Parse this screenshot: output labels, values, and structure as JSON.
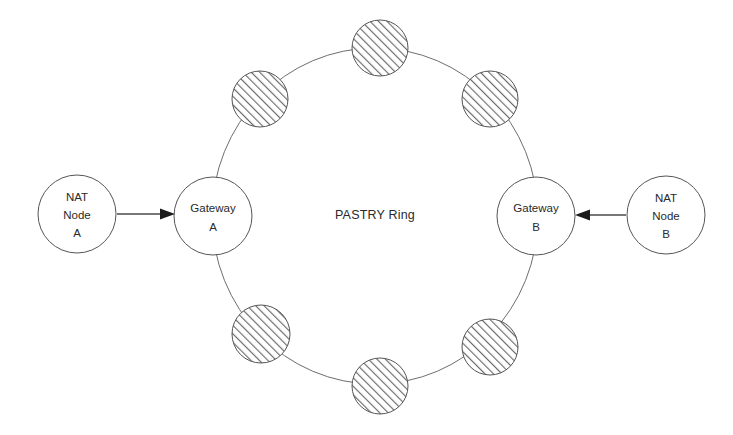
{
  "diagram": {
    "type": "network-topology",
    "center_label": "PASTRY Ring",
    "ring": {
      "center": {
        "x": 375,
        "y": 216
      },
      "radius_x": 163,
      "radius_y": 168,
      "stroke_color": "#6e6e6e"
    },
    "gateway_nodes": [
      {
        "id": "gateway-a",
        "lines": [
          "Gateway",
          "A"
        ],
        "cx": 213,
        "cy": 216,
        "r": 39,
        "fill": "#ffffff",
        "stroke": "#555555"
      },
      {
        "id": "gateway-b",
        "lines": [
          "Gateway",
          "B"
        ],
        "cx": 536,
        "cy": 216,
        "r": 39,
        "fill": "#ffffff",
        "stroke": "#555555"
      }
    ],
    "external_nodes": [
      {
        "id": "nat-node-a",
        "lines": [
          "NAT",
          "Node",
          "A"
        ],
        "cx": 77,
        "cy": 214,
        "r": 39,
        "fill": "#ffffff",
        "stroke": "#555555"
      },
      {
        "id": "nat-node-b",
        "lines": [
          "NAT",
          "Node",
          "B"
        ],
        "cx": 666,
        "cy": 215,
        "r": 39,
        "fill": "#ffffff",
        "stroke": "#555555"
      }
    ],
    "ring_member_nodes": [
      {
        "id": "ring-node-1",
        "cx": 260,
        "cy": 99,
        "r": 28,
        "pattern": "diagonal-hatch"
      },
      {
        "id": "ring-node-2",
        "cx": 380,
        "cy": 48,
        "r": 28,
        "pattern": "diagonal-hatch"
      },
      {
        "id": "ring-node-3",
        "cx": 490,
        "cy": 99,
        "r": 28,
        "pattern": "diagonal-hatch"
      },
      {
        "id": "ring-node-4",
        "cx": 261,
        "cy": 334,
        "r": 29,
        "pattern": "diagonal-hatch"
      },
      {
        "id": "ring-node-5",
        "cx": 380,
        "cy": 386,
        "r": 28,
        "pattern": "diagonal-hatch"
      },
      {
        "id": "ring-node-6",
        "cx": 490,
        "cy": 347,
        "r": 28,
        "pattern": "diagonal-hatch"
      }
    ],
    "connections": [
      {
        "id": "nat-a-to-gateway-a",
        "from": "nat-node-a",
        "to": "gateway-a",
        "direction": "right",
        "x1": 117,
        "x2": 174,
        "y": 214
      },
      {
        "id": "nat-b-to-gateway-b",
        "from": "nat-node-b",
        "to": "gateway-b",
        "direction": "left",
        "x1": 626,
        "x2": 577,
        "y": 215
      }
    ],
    "colors": {
      "background": "#ffffff",
      "line": "#555555",
      "ring_line": "#6e6e6e",
      "text": "#2a2a2a",
      "arrow": "#1a1a1a",
      "hatch": "#6b6b6b"
    }
  }
}
